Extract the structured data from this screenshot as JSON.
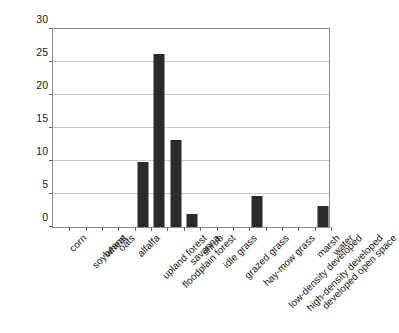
{
  "chart_data": {
    "type": "bar",
    "title": "",
    "xlabel": "",
    "ylabel": "House Wrens/100 acres",
    "ylim": [
      0,
      30
    ],
    "ytick_values": [
      0,
      5,
      10,
      15,
      20,
      25,
      30
    ],
    "ytick_labels": [
      "0",
      "5",
      "10",
      "15",
      "20",
      "25",
      "30"
    ],
    "grid": true,
    "legend": "none",
    "bar_color": "#2b2b2b",
    "categories": [
      "corn",
      "soybeans",
      "wheat",
      "oats",
      "alfalfa",
      "upland forest",
      "floodplain forest",
      "savanna",
      "shrub",
      "idle grass",
      "grazed grass",
      "hay-mow grass",
      "low-density developed",
      "high-density developed",
      "developed open space",
      "marsh",
      "water"
    ],
    "values": [
      0,
      0,
      0,
      0,
      0,
      9.8,
      26,
      13,
      1.9,
      0,
      0,
      0,
      4.6,
      0,
      0,
      0,
      3.1
    ]
  }
}
